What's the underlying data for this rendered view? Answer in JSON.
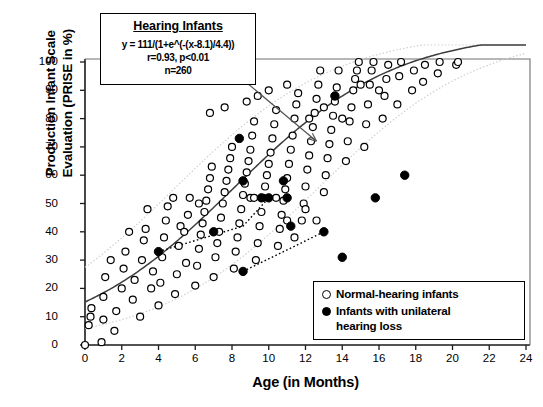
{
  "chart_data": {
    "type": "scatter",
    "title": "",
    "xlabel": "Age (in Months)",
    "ylabel": "Production Infant Scale Evaluation (PRISE in %)",
    "ylabel_line1": "Production Infant Scale",
    "ylabel_line2": "Evaluation (PRISE in %)",
    "xlim": [
      0,
      24
    ],
    "ylim": [
      0,
      100
    ],
    "xticks": [
      0,
      2,
      4,
      6,
      8,
      10,
      12,
      14,
      16,
      18,
      20,
      22,
      24
    ],
    "yticks": [
      0,
      10,
      20,
      30,
      40,
      50,
      60,
      70,
      80,
      90,
      100
    ],
    "grid": false,
    "legend_position": "bottom-right",
    "annotation": {
      "title": "Hearing Infants",
      "equation": "y = 111/(1+e^(-(x-8.1)/4.4))",
      "stats": "r=0.93, p<0.01",
      "n": "n=260",
      "arrow_from": [
        8.0,
        97.0
      ],
      "arrow_to": [
        12.6,
        72.0
      ]
    },
    "fit_curve": {
      "name": "Hearing infants logistic fit",
      "formula": "y = 111/(1+e^(-(x-8.1)/4.4))",
      "L": 111,
      "x0": 8.1,
      "k": 4.4,
      "r": 0.93,
      "p": "<0.01",
      "n": 260,
      "confidence_band_offset": 18
    },
    "series": [
      {
        "name": "Normal-hearing infants",
        "marker": "open-circle",
        "color": "#000000",
        "points": [
          [
            0.0,
            0.0
          ],
          [
            0.2,
            7.0
          ],
          [
            0.3,
            10.0
          ],
          [
            0.35,
            13.0
          ],
          [
            0.9,
            1.0
          ],
          [
            1.0,
            9.0
          ],
          [
            1.0,
            17.0
          ],
          [
            1.1,
            24.0
          ],
          [
            1.6,
            5.0
          ],
          [
            1.7,
            12.0
          ],
          [
            2.0,
            20.0
          ],
          [
            2.1,
            27.0
          ],
          [
            2.2,
            33.0
          ],
          [
            2.6,
            16.0
          ],
          [
            2.7,
            23.0
          ],
          [
            3.0,
            10.0
          ],
          [
            3.1,
            30.0
          ],
          [
            3.2,
            37.0
          ],
          [
            3.3,
            41.0
          ],
          [
            3.6,
            20.0
          ],
          [
            3.7,
            26.0
          ],
          [
            4.0,
            14.0
          ],
          [
            4.1,
            22.0
          ],
          [
            4.2,
            31.0
          ],
          [
            4.3,
            38.0
          ],
          [
            4.4,
            44.0
          ],
          [
            4.5,
            49.0
          ],
          [
            4.9,
            18.0
          ],
          [
            5.0,
            25.0
          ],
          [
            5.1,
            35.0
          ],
          [
            5.2,
            42.0
          ],
          [
            5.5,
            29.0
          ],
          [
            5.6,
            46.0
          ],
          [
            5.7,
            52.0
          ],
          [
            6.0,
            21.0
          ],
          [
            6.1,
            28.0
          ],
          [
            6.2,
            34.0
          ],
          [
            6.3,
            39.0
          ],
          [
            6.4,
            43.0
          ],
          [
            6.5,
            47.0
          ],
          [
            6.6,
            51.0
          ],
          [
            6.7,
            55.0
          ],
          [
            6.8,
            59.0
          ],
          [
            6.9,
            63.0
          ],
          [
            7.0,
            24.0
          ],
          [
            7.1,
            31.0
          ],
          [
            7.2,
            36.0
          ],
          [
            7.3,
            40.0
          ],
          [
            7.4,
            45.0
          ],
          [
            7.5,
            50.0
          ],
          [
            7.6,
            54.0
          ],
          [
            7.7,
            58.0
          ],
          [
            7.8,
            62.0
          ],
          [
            7.9,
            66.0
          ],
          [
            8.0,
            70.0
          ],
          [
            8.1,
            27.0
          ],
          [
            8.2,
            33.0
          ],
          [
            8.3,
            38.0
          ],
          [
            8.4,
            43.0
          ],
          [
            8.5,
            48.0
          ],
          [
            8.6,
            53.0
          ],
          [
            8.7,
            57.0
          ],
          [
            8.8,
            61.0
          ],
          [
            8.9,
            65.0
          ],
          [
            9.0,
            69.0
          ],
          [
            9.1,
            74.0
          ],
          [
            9.2,
            79.0
          ],
          [
            9.3,
            30.0
          ],
          [
            9.4,
            36.0
          ],
          [
            9.5,
            42.0
          ],
          [
            9.6,
            47.0
          ],
          [
            9.7,
            52.0
          ],
          [
            9.8,
            56.0
          ],
          [
            9.9,
            60.0
          ],
          [
            10.0,
            64.0
          ],
          [
            10.1,
            68.0
          ],
          [
            10.2,
            73.0
          ],
          [
            10.3,
            78.0
          ],
          [
            10.4,
            83.0
          ],
          [
            10.5,
            35.0
          ],
          [
            10.6,
            41.0
          ],
          [
            10.7,
            46.0
          ],
          [
            10.8,
            51.0
          ],
          [
            10.9,
            55.0
          ],
          [
            11.0,
            59.0
          ],
          [
            11.1,
            64.0
          ],
          [
            11.2,
            69.0
          ],
          [
            11.3,
            74.0
          ],
          [
            11.4,
            80.0
          ],
          [
            11.5,
            85.0
          ],
          [
            11.6,
            89.0
          ],
          [
            11.8,
            44.0
          ],
          [
            11.9,
            50.0
          ],
          [
            12.0,
            56.0
          ],
          [
            12.1,
            62.0
          ],
          [
            12.2,
            67.0
          ],
          [
            12.3,
            72.0
          ],
          [
            12.4,
            77.0
          ],
          [
            12.5,
            82.0
          ],
          [
            12.6,
            87.0
          ],
          [
            12.7,
            92.0
          ],
          [
            12.8,
            97.0
          ],
          [
            13.0,
            54.0
          ],
          [
            13.1,
            60.0
          ],
          [
            13.2,
            66.0
          ],
          [
            13.3,
            71.0
          ],
          [
            13.4,
            76.0
          ],
          [
            13.5,
            81.0
          ],
          [
            13.6,
            86.0
          ],
          [
            13.7,
            91.0
          ],
          [
            13.8,
            97.0
          ],
          [
            14.2,
            65.0
          ],
          [
            14.3,
            72.0
          ],
          [
            14.4,
            79.0
          ],
          [
            14.5,
            84.0
          ],
          [
            14.6,
            90.0
          ],
          [
            14.7,
            94.0
          ],
          [
            14.8,
            97.0
          ],
          [
            14.9,
            100.0
          ],
          [
            15.2,
            70.0
          ],
          [
            15.3,
            78.0
          ],
          [
            15.4,
            85.0
          ],
          [
            15.5,
            92.0
          ],
          [
            15.6,
            97.0
          ],
          [
            15.7,
            100.0
          ],
          [
            16.2,
            80.0
          ],
          [
            16.3,
            88.0
          ],
          [
            16.4,
            94.0
          ],
          [
            16.5,
            99.0
          ],
          [
            17.0,
            85.0
          ],
          [
            17.1,
            95.0
          ],
          [
            17.2,
            100.0
          ],
          [
            17.8,
            90.0
          ],
          [
            17.9,
            97.0
          ],
          [
            18.4,
            93.0
          ],
          [
            18.5,
            99.0
          ],
          [
            19.2,
            96.0
          ],
          [
            19.3,
            100.0
          ],
          [
            20.2,
            99.0
          ],
          [
            20.3,
            100.0
          ],
          [
            8.8,
            86.0
          ],
          [
            9.4,
            88.0
          ],
          [
            10.0,
            90.0
          ],
          [
            11.0,
            92.0
          ],
          [
            7.6,
            84.0
          ],
          [
            6.8,
            82.0
          ],
          [
            12.2,
            80.0
          ],
          [
            13.0,
            84.0
          ],
          [
            15.0,
            92.0
          ],
          [
            16.0,
            90.0
          ],
          [
            14.0,
            80.0
          ],
          [
            3.4,
            48.0
          ],
          [
            4.8,
            52.0
          ],
          [
            5.4,
            40.0
          ],
          [
            6.2,
            50.0
          ],
          [
            2.4,
            40.0
          ],
          [
            1.4,
            30.0
          ],
          [
            9.0,
            52.0
          ],
          [
            9.2,
            52.0
          ],
          [
            10.4,
            52.0
          ],
          [
            11.0,
            44.0
          ],
          [
            11.4,
            38.0
          ],
          [
            12.0,
            48.0
          ],
          [
            12.6,
            44.0
          ]
        ]
      },
      {
        "name": "Infants with unilateral hearing loss",
        "marker": "filled-circle",
        "color": "#000000",
        "points": [
          [
            4.0,
            33.0
          ],
          [
            7.0,
            40.0
          ],
          [
            8.4,
            73.0
          ],
          [
            8.6,
            58.0
          ],
          [
            8.6,
            26.0
          ],
          [
            9.6,
            52.0
          ],
          [
            10.0,
            52.0
          ],
          [
            10.8,
            58.0
          ],
          [
            11.0,
            52.0
          ],
          [
            11.2,
            42.0
          ],
          [
            13.0,
            40.0
          ],
          [
            13.6,
            88.0
          ],
          [
            14.0,
            31.0
          ],
          [
            15.8,
            52.0
          ],
          [
            17.4,
            60.0
          ]
        ]
      }
    ],
    "trend_lines": [
      {
        "name": "unilateral-loss-trend-upper",
        "style": "dotted",
        "points": [
          [
            4.0,
            33.0
          ],
          [
            8.6,
            42.0
          ],
          [
            10.0,
            52.0
          ],
          [
            11.2,
            52.0
          ]
        ]
      },
      {
        "name": "unilateral-loss-trend-lower",
        "style": "dotted",
        "points": [
          [
            8.6,
            26.0
          ],
          [
            13.0,
            40.0
          ]
        ]
      }
    ]
  },
  "legend": {
    "items": [
      {
        "marker": "open-circle",
        "label": "Normal-hearing infants"
      },
      {
        "marker": "filled-circle",
        "label": "Infants with unilateral hearing loss",
        "label_line1": "Infants with unilateral",
        "label_line2": "hearing loss"
      }
    ]
  },
  "colors": {
    "axis": "#1a1a1a",
    "curve": "#3d3d3d",
    "band": "#d0d0d0",
    "marker": "#000000",
    "background": "#ffffff"
  }
}
